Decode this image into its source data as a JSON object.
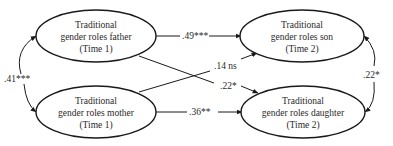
{
  "nodes": {
    "father": {
      "line1": "Traditional",
      "line2": "gender roles father",
      "line3": "(Time 1)"
    },
    "mother": {
      "line1": "Traditional",
      "line2": "gender roles mother",
      "line3": "(Time 1)"
    },
    "son": {
      "line1": "Traditional",
      "line2": "gender roles son",
      "line3": "(Time 2)"
    },
    "daughter": {
      "line1": "Traditional",
      "line2": "gender roles daughter",
      "line3": "(Time 2)"
    }
  },
  "edges": {
    "father_son": ".49***",
    "mother_son": ".14 ns",
    "father_daughter": ".22*",
    "mother_daughter": ".36**",
    "father_mother_covariance": ".41***",
    "son_daughter_covariance": ".22*"
  },
  "colors": {
    "stroke": "#1a1a1a",
    "text": "#2a2a2a",
    "background": "#ffffff"
  }
}
